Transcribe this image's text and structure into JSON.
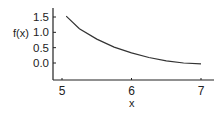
{
  "chart_data": {
    "type": "line",
    "title": "",
    "xlabel": "x",
    "ylabel": "f(x)",
    "xlim": [
      4.9,
      7.15
    ],
    "ylim": [
      -0.55,
      1.8
    ],
    "x_ticks": [
      5,
      6,
      7
    ],
    "x_tick_labels": [
      "5",
      "6",
      "7"
    ],
    "y_ticks": [
      1.5,
      1.0,
      0.5,
      0.0
    ],
    "y_tick_labels": [
      "1.5",
      "1.0",
      "0.5",
      "0.0"
    ],
    "grid": false,
    "legend": null,
    "series": [
      {
        "name": "f(x)",
        "x": [
          5.06,
          5.25,
          5.5,
          5.75,
          6.0,
          6.25,
          6.5,
          6.75,
          7.0
        ],
        "y": [
          1.53,
          1.12,
          0.78,
          0.52,
          0.33,
          0.18,
          0.07,
          0.0,
          -0.03
        ]
      }
    ]
  },
  "colors": {
    "line": "#333333",
    "axis": "#222222",
    "text": "#222222"
  }
}
